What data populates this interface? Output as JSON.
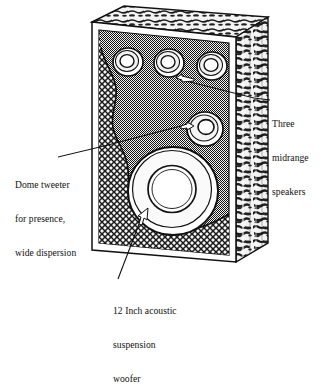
{
  "figure": {
    "type": "technical-illustration",
    "view": "three-quarter perspective, front-left"
  },
  "callouts": [
    {
      "id": "midrange",
      "name": "three-midrange-speakers",
      "lines": [
        "Three",
        "midrange",
        "speakers"
      ],
      "text": "Three midrange speakers",
      "position": "right",
      "arrow": {
        "from_x": 272,
        "from_y": 101,
        "to_x": 172,
        "to_y": 78,
        "head": "left",
        "style": "white-outlined"
      }
    },
    {
      "id": "tweeter",
      "name": "dome-tweeter",
      "lines": [
        "Dome tweeter",
        "for presence,",
        "wide dispersion"
      ],
      "text": "Dome tweeter for presence, wide dispersion",
      "position": "left",
      "arrow": {
        "from_x": 60,
        "from_y": 157,
        "to_x": 190,
        "to_y": 124,
        "head": "right",
        "style": "white-outlined"
      }
    },
    {
      "id": "woofer",
      "name": "twelve-inch-acoustic-suspension-woofer",
      "lines": [
        "12 Inch acoustic",
        "suspension",
        "woofer"
      ],
      "text": "12 Inch acoustic suspension woofer",
      "position": "bottom",
      "arrow": {
        "from_x": 118,
        "from_y": 278,
        "to_x": 152,
        "to_y": 208,
        "head": "up-right",
        "style": "white-outlined"
      }
    }
  ],
  "components": [
    {
      "name": "midrange-speaker-left",
      "cx": 128,
      "cy": 62,
      "r_outer": 15,
      "r_inner": 8,
      "kind": "midrange-driver"
    },
    {
      "name": "midrange-speaker-center",
      "cx": 169,
      "cy": 62,
      "r_outer": 15,
      "r_inner": 8,
      "kind": "midrange-driver"
    },
    {
      "name": "midrange-speaker-right",
      "cx": 212,
      "cy": 65,
      "r_outer": 15,
      "r_inner": 8,
      "kind": "midrange-driver"
    },
    {
      "name": "dome-tweeter",
      "cx": 205,
      "cy": 128,
      "r_outer": 17,
      "r_inner": 9,
      "kind": "tweeter-dome"
    },
    {
      "name": "woofer",
      "cx": 172,
      "cy": 190,
      "r_outer": 44,
      "r_inner": 24,
      "kind": "woofer-cone"
    }
  ],
  "cabinet": {
    "name": "speaker-enclosure",
    "front_panel": "gray-dithered-baffle",
    "side_panel": "cut-particle-board-edge",
    "top_panel": "cut-particle-board-edge",
    "cutaway_region": "cross-hatched-damping-material",
    "colors": {
      "ink": "#111111",
      "paper": "#ffffff",
      "baffle_gray": "#8c8c8c",
      "cutaway_gray": "#6f6f6f",
      "board_light": "#e8e8e8",
      "board_dark": "#2a2a2a"
    }
  }
}
